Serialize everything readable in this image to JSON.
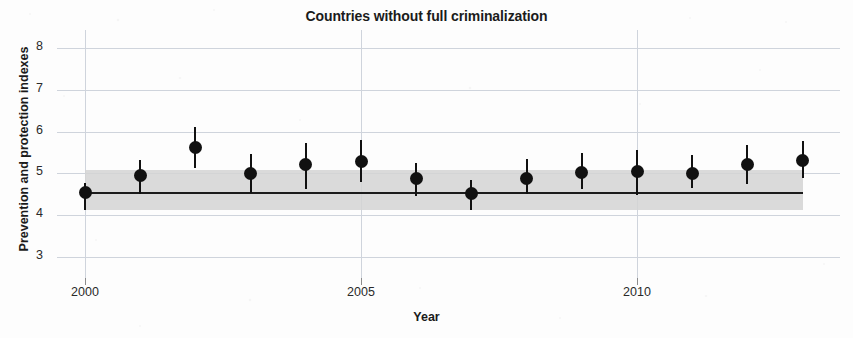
{
  "chart_data": {
    "type": "scatter",
    "title": "Countries without full criminalization",
    "xlabel": "Year",
    "ylabel": "Prevention and protection indexes",
    "grid": true,
    "legend": "none",
    "xlim": [
      2000,
      2013.2
    ],
    "ylim": [
      2.75,
      8.3
    ],
    "y_ticks": [
      8,
      7,
      6,
      5,
      4,
      3
    ],
    "x_ticks": [
      2000,
      2005,
      2010
    ],
    "x_tick_labels": [
      "2000",
      "2005",
      "2010"
    ],
    "x": [
      2000,
      2001,
      2002,
      2003,
      2004,
      2005,
      2006,
      2007,
      2008,
      2009,
      2010,
      2011,
      2012,
      2013
    ],
    "values": [
      4.55,
      4.96,
      5.63,
      4.99,
      5.21,
      5.29,
      4.88,
      4.52,
      4.87,
      5.03,
      5.05,
      5.0,
      5.21,
      5.32
    ],
    "error_low": [
      4.11,
      4.5,
      5.12,
      4.54,
      4.62,
      4.8,
      4.45,
      4.11,
      4.5,
      4.62,
      4.48,
      4.65,
      4.75,
      4.88
    ],
    "error_high": [
      4.78,
      5.31,
      6.12,
      5.47,
      5.73,
      5.81,
      5.26,
      4.83,
      5.34,
      5.49,
      5.57,
      5.45,
      5.69,
      5.77
    ],
    "reference_line": {
      "value": 4.55,
      "label": "overall mean"
    },
    "reference_band": {
      "low": 4.11,
      "high": 5.07,
      "label": "confidence band"
    },
    "colors": {
      "point": "#111111",
      "whisker": "#111111",
      "reference_line": "#1b1b1b",
      "reference_band": "#d4d4d4",
      "grid": "#cfd4dc",
      "background": "#fdfdfd",
      "text": "#1b1b1b"
    }
  }
}
